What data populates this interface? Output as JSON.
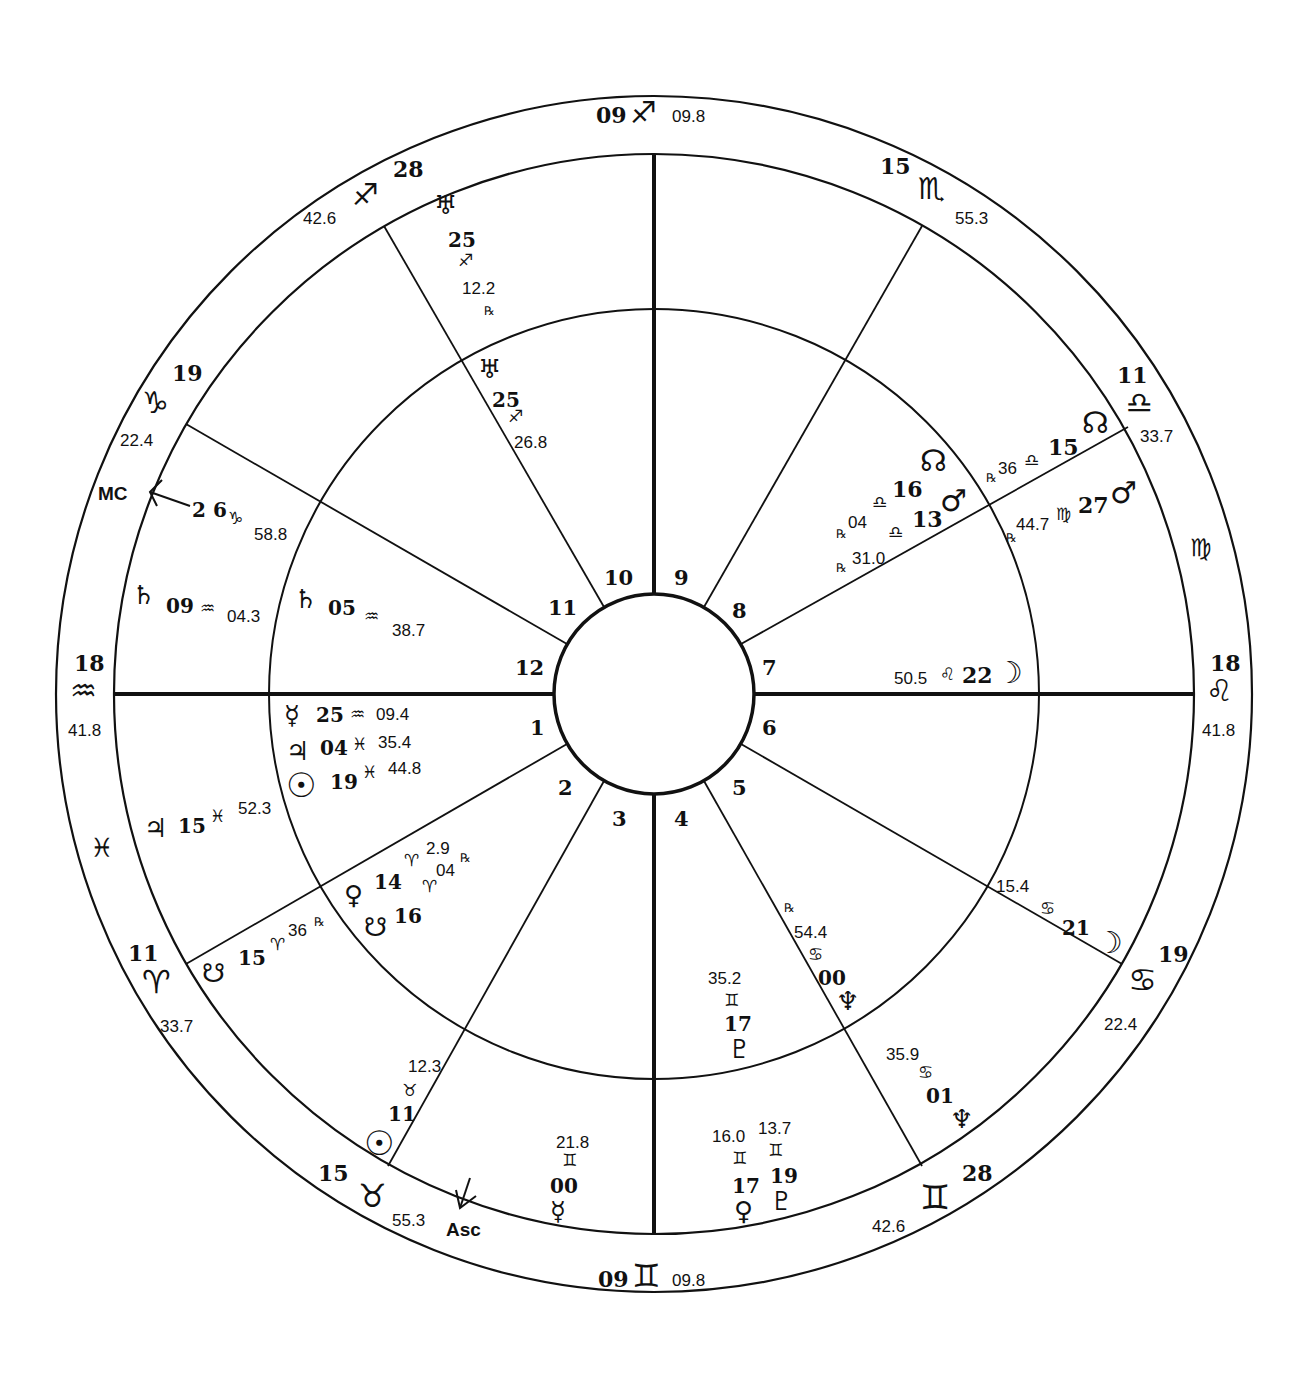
{
  "chart": {
    "type": "bi-wheel natal/transit chart",
    "center": [
      654,
      694
    ],
    "colors": {
      "ink": "#111111",
      "background": "#ffffff"
    }
  },
  "house_numbers": [
    "1",
    "2",
    "3",
    "4",
    "5",
    "6",
    "7",
    "8",
    "9",
    "10",
    "11",
    "12"
  ],
  "axes": {
    "mc_label": "MC",
    "asc_label": "Asc",
    "mc_degree": "2 6",
    "mc_sign": "♑",
    "mc_minutes": "58.8",
    "asc_degree": "21",
    "asc_sign": "♉",
    "asc_minutes": "08.4"
  },
  "outer_cusps": [
    {
      "deg": "09",
      "sign": "♐",
      "min": "09.8",
      "position": "top"
    },
    {
      "deg": "28",
      "sign": "♐",
      "min": "42.6",
      "position": "upper-left"
    },
    {
      "deg": "15",
      "sign": "♏",
      "min": "55.3",
      "position": "upper-right"
    },
    {
      "deg": "19",
      "sign": "♑",
      "min": "22.4",
      "position": "left-upper"
    },
    {
      "deg": "11",
      "sign": "♎",
      "min": "33.7",
      "position": "right-upper"
    },
    {
      "deg": "18",
      "sign": "♒",
      "min": "41.8",
      "position": "left"
    },
    {
      "deg": "18",
      "sign": "♌",
      "min": "41.8",
      "position": "right"
    },
    {
      "deg": "11",
      "sign": "♈",
      "min": "33.7",
      "position": "left-lower"
    },
    {
      "deg": "19",
      "sign": "♋",
      "min": "22.4",
      "position": "right-lower"
    },
    {
      "deg": "15",
      "sign": "♉",
      "min": "55.3",
      "position": "lower-left"
    },
    {
      "deg": "28",
      "sign": "♊",
      "min": "42.6",
      "position": "lower-right"
    },
    {
      "deg": "09",
      "sign": "♊",
      "min": "09.8",
      "position": "bottom"
    }
  ],
  "intercepted_signs": {
    "left": "♓",
    "right": "♍"
  },
  "outer_ring_planets": [
    {
      "glyph": "♅",
      "deg": "25",
      "sign": "♐",
      "min": "12.2",
      "rx": "℞"
    },
    {
      "glyph": "♄",
      "deg": "09",
      "sign": "♒",
      "min": "04.3"
    },
    {
      "glyph": "♃",
      "deg": "15",
      "sign": "♓",
      "min": "52.3"
    },
    {
      "glyph": "☋",
      "deg": "15",
      "sign": "♈",
      "min": "36",
      "rx": "℞"
    },
    {
      "glyph": "☉",
      "deg": "11",
      "sign": "♉",
      "min": "12.3"
    },
    {
      "glyph": "☿",
      "deg": "00",
      "sign": "♊",
      "min": "21.8"
    },
    {
      "glyph": "♀",
      "deg": "17",
      "sign": "♊",
      "min": "16.0"
    },
    {
      "glyph": "♇",
      "deg": "19",
      "sign": "♊",
      "min": "13.7"
    },
    {
      "glyph": "♆",
      "deg": "01",
      "sign": "♋",
      "min": "35.9"
    },
    {
      "glyph": "☽",
      "deg": "21",
      "sign": "♋",
      "min": "15.4"
    },
    {
      "glyph": "♂",
      "deg": "27",
      "sign": "♍",
      "min": "44.7",
      "rx": "℞"
    },
    {
      "glyph": "☊",
      "deg": "15",
      "sign": "♎",
      "min": "36",
      "rx": "℞"
    }
  ],
  "inner_ring_planets": [
    {
      "glyph": "♅",
      "deg": "25",
      "sign": "♐",
      "min": "26.8"
    },
    {
      "glyph": "♄",
      "deg": "05",
      "sign": "♒",
      "min": "38.7"
    },
    {
      "glyph": "☿",
      "deg": "25",
      "sign": "♒",
      "min": "09.4"
    },
    {
      "glyph": "♃",
      "deg": "04",
      "sign": "♓",
      "min": "35.4"
    },
    {
      "glyph": "☉",
      "deg": "19",
      "sign": "♓",
      "min": "44.8"
    },
    {
      "glyph": "♀",
      "deg": "14",
      "sign": "♈",
      "min": "2.9",
      "rx": "℞"
    },
    {
      "glyph": "☋",
      "deg": "16",
      "sign": "♈",
      "min": "04"
    },
    {
      "glyph": "♇",
      "deg": "17",
      "sign": "♊",
      "min": "35.2"
    },
    {
      "glyph": "♆",
      "deg": "00",
      "sign": "♋",
      "min": "54.4",
      "rx": "℞"
    },
    {
      "glyph": "☽",
      "deg": "22",
      "sign": "♌",
      "min": "50.5"
    },
    {
      "glyph": "♂",
      "deg": "13",
      "sign": "♎",
      "min": "31.0",
      "rx": "℞"
    },
    {
      "glyph": "☊",
      "deg": "16",
      "sign": "♎",
      "min": "04",
      "rx": "℞"
    }
  ],
  "rx_symbol": "℞"
}
